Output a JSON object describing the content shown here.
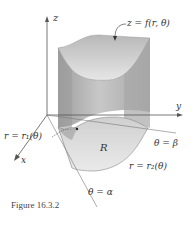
{
  "figure": {
    "caption": "Figure 16.3.2",
    "axes": {
      "x_label": "x",
      "y_label": "y",
      "z_label": "z"
    },
    "labels": {
      "surface": "z = f(r, θ)",
      "inner_curve": "r = r₁(θ)",
      "outer_curve": "r = r₂(θ)",
      "region": "R",
      "ray_beta": "θ = β",
      "ray_alpha": "θ = α"
    },
    "colors": {
      "solid_side": "#a9a9a9",
      "solid_front": "#c4c4c4",
      "top_surface": "#d9d9d9",
      "region_fill": "#e2e2e2",
      "axis": "#555555",
      "text": "#333333"
    }
  }
}
